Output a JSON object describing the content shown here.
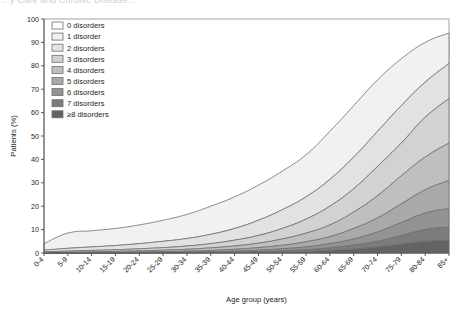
{
  "figure": {
    "clipped_title_fragment": "...y Care and Chronic Disease...",
    "background": "#ffffff"
  },
  "axes": {
    "y": {
      "title": "Patients (%)",
      "ticks": [
        0,
        10,
        20,
        30,
        40,
        50,
        60,
        70,
        80,
        90,
        100
      ],
      "min": 0,
      "max": 100
    },
    "x": {
      "title": "Age group (years)",
      "ticks": [
        "0-4",
        "5-9",
        "10-14",
        "15-19",
        "20-24",
        "25-29",
        "30-34",
        "35-39",
        "40-44",
        "45-49",
        "50-54",
        "55-59",
        "60-64",
        "65-69",
        "70-74",
        "75-79",
        "80-84",
        "85+"
      ],
      "label_rotation_deg": -45
    }
  },
  "legend": {
    "position": "top-left-inside",
    "items": [
      {
        "label": "0 disorders",
        "color": "#ffffff"
      },
      {
        "label": "1 disorder",
        "color": "#f1f1f1"
      },
      {
        "label": "2 disorders",
        "color": "#e2e2e2"
      },
      {
        "label": "3 disorders",
        "color": "#d2d2d2"
      },
      {
        "label": "4 disorders",
        "color": "#bfbfbf"
      },
      {
        "label": "5 disorders",
        "color": "#a9a9a9"
      },
      {
        "label": "6 disorders",
        "color": "#939393"
      },
      {
        "label": "7 disorders",
        "color": "#7c7c7c"
      },
      {
        "label": "≥8 disorders",
        "color": "#636363"
      }
    ]
  },
  "chart_data": {
    "type": "area",
    "stacked": true,
    "stack_order": "bottom-to-top: ≥8 disorders, 7, 6, 5, 4, 3, 2, 1 disorder; remainder to 100% is 0 disorders",
    "title": "",
    "xlabel": "Age group (years)",
    "ylabel": "Patients (%)",
    "ylim": [
      0,
      100
    ],
    "grid": false,
    "categories": [
      "0-4",
      "5-9",
      "10-14",
      "15-19",
      "20-24",
      "25-29",
      "30-34",
      "35-39",
      "40-44",
      "45-49",
      "50-54",
      "55-59",
      "60-64",
      "65-69",
      "70-74",
      "75-79",
      "80-84",
      "85+"
    ],
    "cumulative_boundaries": {
      "description": "Percentage of patients with at least N disorders; these are the stacked upper edges drawn in the figure.",
      "at_least_1": [
        4.0,
        8.5,
        9.5,
        10.5,
        12.0,
        14.0,
        16.5,
        20.0,
        24.0,
        29.0,
        35.0,
        42.0,
        52.0,
        63.0,
        74.0,
        83.0,
        90.0,
        94.0
      ],
      "at_least_2": [
        1.2,
        2.0,
        2.6,
        3.2,
        4.0,
        5.0,
        6.2,
        8.0,
        10.5,
        14.0,
        18.5,
        24.0,
        31.5,
        41.0,
        52.0,
        63.0,
        73.0,
        81.0
      ],
      "at_least_3": [
        0.5,
        0.8,
        1.1,
        1.4,
        1.8,
        2.3,
        3.0,
        4.0,
        5.5,
        7.5,
        10.5,
        14.5,
        20.0,
        27.5,
        37.0,
        47.0,
        58.0,
        66.0
      ],
      "at_least_4": [
        0.2,
        0.3,
        0.5,
        0.7,
        0.9,
        1.2,
        1.6,
        2.2,
        3.0,
        4.2,
        6.0,
        8.5,
        12.0,
        17.5,
        24.5,
        33.0,
        41.0,
        47.0
      ],
      "at_least_5": [
        0.1,
        0.15,
        0.2,
        0.3,
        0.4,
        0.6,
        0.8,
        1.1,
        1.6,
        2.3,
        3.3,
        4.8,
        7.0,
        10.5,
        15.0,
        21.0,
        27.0,
        31.0
      ],
      "at_least_6": [
        0.0,
        0.05,
        0.1,
        0.15,
        0.2,
        0.3,
        0.4,
        0.6,
        0.8,
        1.2,
        1.8,
        2.6,
        4.0,
        6.0,
        9.0,
        13.0,
        17.0,
        19.0
      ],
      "at_least_7": [
        0.0,
        0.0,
        0.05,
        0.05,
        0.1,
        0.15,
        0.2,
        0.3,
        0.4,
        0.6,
        0.9,
        1.4,
        2.2,
        3.4,
        5.0,
        7.5,
        10.0,
        11.0
      ],
      "at_least_8": [
        0.0,
        0.0,
        0.0,
        0.0,
        0.05,
        0.05,
        0.1,
        0.15,
        0.2,
        0.3,
        0.45,
        0.7,
        1.1,
        1.7,
        2.6,
        3.8,
        5.0,
        5.5
      ]
    },
    "series": [
      {
        "name": "0 disorders",
        "color": "#ffffff",
        "values": [
          96.0,
          91.5,
          90.5,
          89.5,
          88.0,
          86.0,
          83.5,
          80.0,
          76.0,
          71.0,
          65.0,
          58.0,
          48.0,
          37.0,
          26.0,
          17.0,
          10.0,
          6.0
        ]
      },
      {
        "name": "1 disorder",
        "color": "#f1f1f1",
        "values": [
          2.8,
          6.5,
          6.9,
          7.3,
          8.0,
          9.0,
          10.3,
          12.0,
          13.5,
          15.0,
          16.5,
          18.0,
          20.5,
          22.0,
          22.0,
          20.0,
          17.0,
          13.0
        ]
      },
      {
        "name": "2 disorders",
        "color": "#e2e2e2",
        "values": [
          0.7,
          1.2,
          1.5,
          1.8,
          2.2,
          2.7,
          3.2,
          4.0,
          5.0,
          6.5,
          8.0,
          9.5,
          11.5,
          13.5,
          15.0,
          16.0,
          15.0,
          15.0
        ]
      },
      {
        "name": "3 disorders",
        "color": "#d2d2d2",
        "values": [
          0.3,
          0.5,
          0.6,
          0.7,
          0.9,
          1.1,
          1.4,
          1.8,
          2.5,
          3.3,
          4.5,
          6.0,
          8.0,
          10.0,
          12.5,
          14.0,
          17.0,
          19.0
        ]
      },
      {
        "name": "4 disorders",
        "color": "#bfbfbf",
        "values": [
          0.1,
          0.15,
          0.3,
          0.4,
          0.5,
          0.6,
          0.8,
          1.1,
          1.4,
          1.9,
          2.7,
          3.7,
          5.0,
          7.0,
          9.5,
          12.0,
          14.0,
          16.0
        ]
      },
      {
        "name": "5 disorders",
        "color": "#a9a9a9",
        "values": [
          0.1,
          0.1,
          0.1,
          0.15,
          0.2,
          0.3,
          0.4,
          0.5,
          0.8,
          1.1,
          1.5,
          2.2,
          3.0,
          4.5,
          6.0,
          8.0,
          10.0,
          12.0
        ]
      },
      {
        "name": "6 disorders",
        "color": "#939393",
        "values": [
          0.0,
          0.05,
          0.05,
          0.1,
          0.1,
          0.15,
          0.2,
          0.3,
          0.4,
          0.6,
          0.9,
          1.2,
          1.8,
          2.6,
          4.0,
          5.5,
          7.0,
          8.0
        ]
      },
      {
        "name": "7 disorders",
        "color": "#7c7c7c",
        "values": [
          0.0,
          0.0,
          0.05,
          0.05,
          0.05,
          0.1,
          0.1,
          0.15,
          0.2,
          0.3,
          0.45,
          0.7,
          1.1,
          1.7,
          2.4,
          3.7,
          5.0,
          5.5
        ]
      },
      {
        "name": "≥8 disorders",
        "color": "#636363",
        "values": [
          0.0,
          0.0,
          0.0,
          0.0,
          0.05,
          0.05,
          0.1,
          0.15,
          0.2,
          0.3,
          0.45,
          0.7,
          1.1,
          1.7,
          2.6,
          3.8,
          5.0,
          5.5
        ]
      }
    ]
  }
}
